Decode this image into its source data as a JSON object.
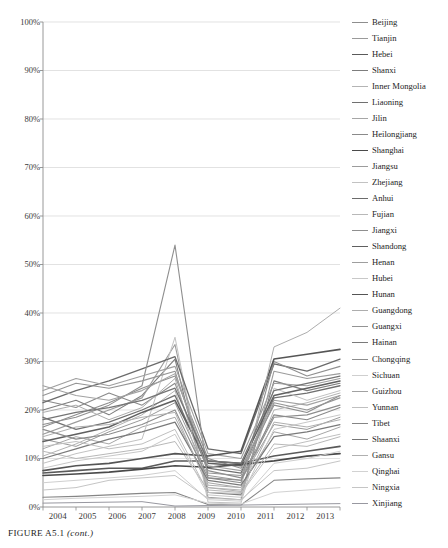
{
  "caption": {
    "main": "FIGURE A5.1",
    "cont": "(cont.)"
  },
  "axis": {
    "y_ticks": [
      "100%",
      "90%",
      "80%",
      "70%",
      "60%",
      "50%",
      "40%",
      "30%",
      "20%",
      "10%",
      "0%"
    ],
    "x_ticks": [
      "2004",
      "2005",
      "2006",
      "2007",
      "2008",
      "2009",
      "2010",
      "2011",
      "2012",
      "2013"
    ]
  },
  "chart_data": {
    "type": "line",
    "title": "",
    "xlabel": "",
    "ylabel": "",
    "ylim": [
      0,
      100
    ],
    "xlim": [
      2004,
      2013
    ],
    "grid": true,
    "legend_position": "right",
    "tick_suffix": "%",
    "x": [
      2004,
      2005,
      2006,
      2007,
      2008,
      2009,
      2010,
      2011,
      2012,
      2013
    ],
    "categories": [
      "2004",
      "2005",
      "2006",
      "2007",
      "2008",
      "2009",
      "2010",
      "2011",
      "2012",
      "2013"
    ],
    "series": [
      {
        "name": "Beijing",
        "color": "#8e8e8e",
        "width": 1.1,
        "values": [
          16.5,
          19.0,
          21.5,
          24.5,
          27.0,
          10.0,
          8.0,
          21.0,
          19.5,
          23.0
        ]
      },
      {
        "name": "Tianjin",
        "color": "#9a9a9a",
        "width": 1.0,
        "values": [
          14.0,
          12.5,
          15.5,
          18.0,
          21.5,
          6.5,
          5.5,
          17.0,
          16.0,
          18.5
        ]
      },
      {
        "name": "Hebei",
        "color": "#5a5a5a",
        "width": 1.6,
        "values": [
          7.0,
          7.5,
          8.0,
          8.0,
          9.5,
          9.5,
          9.0,
          10.5,
          11.5,
          12.5
        ]
      },
      {
        "name": "Shanxi",
        "color": "#7d7d7d",
        "width": 1.1,
        "values": [
          20.0,
          22.0,
          19.0,
          23.0,
          30.5,
          3.0,
          2.5,
          26.0,
          24.0,
          25.5
        ]
      },
      {
        "name": "Inner Mongolia",
        "color": "#b4b4b4",
        "width": 1.0,
        "values": [
          10.5,
          13.0,
          16.0,
          19.0,
          24.0,
          4.0,
          3.5,
          20.0,
          21.5,
          23.5
        ]
      },
      {
        "name": "Liaoning",
        "color": "#707070",
        "width": 1.3,
        "values": [
          18.5,
          16.0,
          17.5,
          20.0,
          23.0,
          8.0,
          7.0,
          22.5,
          23.5,
          25.0
        ]
      },
      {
        "name": "Jilin",
        "color": "#a6a6a6",
        "width": 1.0,
        "values": [
          12.0,
          14.5,
          13.0,
          16.5,
          18.5,
          5.0,
          4.0,
          15.5,
          14.0,
          16.5
        ]
      },
      {
        "name": "Heilongjiang",
        "color": "#8a8a8a",
        "width": 1.1,
        "values": [
          22.0,
          20.5,
          23.5,
          21.0,
          25.5,
          7.5,
          6.0,
          19.0,
          18.0,
          20.5
        ]
      },
      {
        "name": "Shanghai",
        "color": "#4a4a4a",
        "width": 1.7,
        "values": [
          6.5,
          6.8,
          7.2,
          7.8,
          8.5,
          8.2,
          8.8,
          9.5,
          10.5,
          11.0
        ]
      },
      {
        "name": "Jiangsu",
        "color": "#9c9c9c",
        "width": 1.1,
        "values": [
          15.0,
          17.5,
          20.0,
          22.5,
          33.5,
          2.0,
          1.5,
          28.0,
          26.5,
          27.5
        ]
      },
      {
        "name": "Zhejiang",
        "color": "#c2c2c2",
        "width": 1.0,
        "values": [
          9.0,
          11.0,
          12.5,
          14.0,
          35.0,
          1.0,
          0.8,
          24.5,
          22.0,
          24.0
        ]
      },
      {
        "name": "Anhui",
        "color": "#6b6b6b",
        "width": 1.3,
        "values": [
          21.5,
          24.0,
          26.0,
          28.5,
          31.0,
          12.0,
          11.0,
          29.5,
          28.0,
          30.5
        ]
      },
      {
        "name": "Fujian",
        "color": "#b8b8b8",
        "width": 1.0,
        "values": [
          11.5,
          10.0,
          11.0,
          12.0,
          13.5,
          3.5,
          3.0,
          13.0,
          12.5,
          14.5
        ]
      },
      {
        "name": "Jiangxi",
        "color": "#8f8f8f",
        "width": 1.1,
        "values": [
          17.0,
          18.5,
          21.0,
          25.0,
          54.0,
          6.0,
          5.0,
          30.0,
          27.0,
          29.0
        ]
      },
      {
        "name": "Shandong",
        "color": "#606060",
        "width": 1.5,
        "values": [
          13.5,
          15.0,
          16.5,
          19.5,
          22.0,
          9.0,
          8.5,
          23.0,
          24.5,
          26.0
        ]
      },
      {
        "name": "Henan",
        "color": "#9e9e9e",
        "width": 1.1,
        "values": [
          24.0,
          26.5,
          25.0,
          27.0,
          29.0,
          11.0,
          10.0,
          25.5,
          25.0,
          26.5
        ]
      },
      {
        "name": "Hubei",
        "color": "#c8c8c8",
        "width": 1.0,
        "values": [
          8.0,
          9.5,
          10.5,
          11.5,
          15.0,
          2.5,
          2.0,
          16.0,
          17.5,
          19.0
        ]
      },
      {
        "name": "Hunan",
        "color": "#555555",
        "width": 1.6,
        "values": [
          7.5,
          8.5,
          9.0,
          10.0,
          11.0,
          10.5,
          11.5,
          30.5,
          31.5,
          32.5
        ]
      },
      {
        "name": "Guangdong",
        "color": "#adadad",
        "width": 1.0,
        "values": [
          19.5,
          21.0,
          18.0,
          20.5,
          26.5,
          4.5,
          4.0,
          33.0,
          36.0,
          41.0
        ]
      },
      {
        "name": "Guangxi",
        "color": "#949494",
        "width": 1.1,
        "values": [
          23.0,
          25.5,
          24.5,
          26.0,
          28.0,
          7.0,
          6.5,
          21.5,
          20.0,
          22.5
        ]
      },
      {
        "name": "Hainan",
        "color": "#7a7a7a",
        "width": 1.2,
        "values": [
          10.0,
          12.0,
          14.0,
          15.5,
          17.5,
          5.5,
          4.5,
          14.5,
          15.5,
          17.0
        ]
      },
      {
        "name": "Chongqing",
        "color": "#8c8c8c",
        "width": 1.1,
        "values": [
          16.0,
          14.0,
          15.0,
          17.0,
          20.0,
          6.0,
          5.5,
          18.5,
          19.0,
          21.0
        ]
      },
      {
        "name": "Sichuan",
        "color": "#cfcfcf",
        "width": 1.0,
        "values": [
          5.0,
          5.5,
          6.0,
          6.5,
          7.5,
          1.5,
          1.2,
          9.0,
          10.0,
          11.5
        ]
      },
      {
        "name": "Guizhou",
        "color": "#a2a2a2",
        "width": 1.1,
        "values": [
          25.0,
          23.0,
          22.0,
          24.0,
          27.5,
          8.5,
          7.5,
          22.0,
          21.0,
          23.0
        ]
      },
      {
        "name": "Yunnan",
        "color": "#bfbfbf",
        "width": 1.0,
        "values": [
          12.5,
          13.5,
          12.0,
          13.0,
          16.0,
          3.0,
          2.8,
          12.0,
          13.5,
          15.0
        ]
      },
      {
        "name": "Tibet",
        "color": "#858585",
        "width": 1.1,
        "values": [
          2.0,
          2.2,
          2.5,
          2.8,
          3.0,
          0.5,
          0.4,
          5.5,
          5.8,
          6.0
        ]
      },
      {
        "name": "Shaanxi",
        "color": "#747474",
        "width": 1.3,
        "values": [
          18.0,
          19.5,
          20.5,
          22.0,
          24.5,
          9.5,
          9.0,
          24.0,
          25.5,
          27.0
        ]
      },
      {
        "name": "Gansu",
        "color": "#b0b0b0",
        "width": 1.0,
        "values": [
          14.5,
          16.5,
          17.0,
          18.5,
          19.5,
          4.0,
          3.2,
          17.5,
          16.5,
          18.0
        ]
      },
      {
        "name": "Qinghai",
        "color": "#d2d2d2",
        "width": 1.0,
        "values": [
          1.5,
          1.8,
          2.0,
          2.2,
          2.5,
          0.8,
          0.6,
          3.0,
          3.5,
          4.0
        ]
      },
      {
        "name": "Ningxia",
        "color": "#c5c5c5",
        "width": 1.0,
        "values": [
          3.5,
          4.0,
          5.5,
          6.0,
          6.5,
          1.8,
          1.5,
          7.5,
          8.0,
          9.5
        ]
      },
      {
        "name": "Xinjiang",
        "color": "#9898a0",
        "width": 1.0,
        "values": [
          0.8,
          0.9,
          1.0,
          1.1,
          0.2,
          0.3,
          0.4,
          0.5,
          0.6,
          0.7
        ]
      }
    ]
  }
}
